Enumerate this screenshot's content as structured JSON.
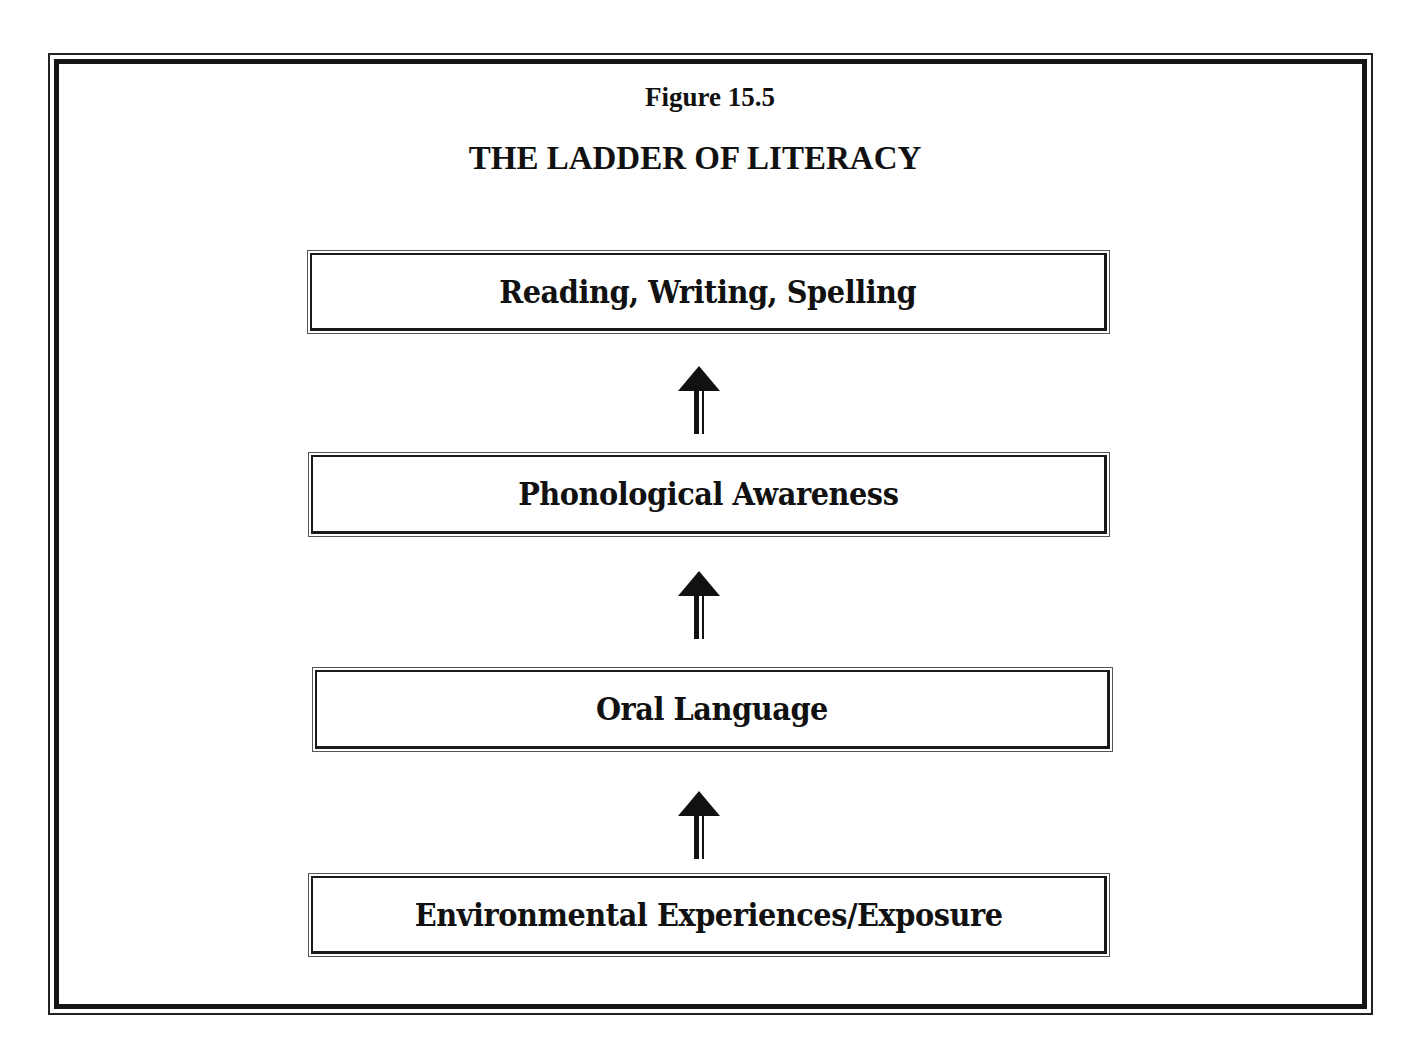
{
  "figure": {
    "number": "Figure 15.5",
    "title": "THE LADDER OF LITERACY"
  },
  "ladder": {
    "rungs": [
      {
        "label": "Reading, Writing, Spelling",
        "level": 4
      },
      {
        "label": "Phonological Awareness",
        "level": 3
      },
      {
        "label": "Oral Language",
        "level": 2
      },
      {
        "label": "Environmental Experiences/Exposure",
        "level": 1
      }
    ],
    "arrows": [
      {
        "icon": "up-arrow-icon",
        "from": "Phonological Awareness",
        "to": "Reading, Writing, Spelling"
      },
      {
        "icon": "up-arrow-icon",
        "from": "Oral Language",
        "to": "Phonological Awareness"
      },
      {
        "icon": "up-arrow-icon",
        "from": "Environmental Experiences/Exposure",
        "to": "Oral Language"
      }
    ]
  },
  "colors": {
    "ink": "#111111",
    "background": "#ffffff"
  }
}
